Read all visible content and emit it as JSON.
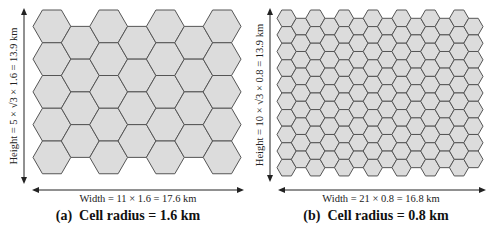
{
  "figure": {
    "panels": [
      {
        "id": "a",
        "caption": "(a)  Cell radius = 1.6 km",
        "width_label": "Width = 11 × 1.6 = 17.6 km",
        "height_label": "Height = 5 × √3 × 1.6 = 13.9 km",
        "cell_radius_km": 1.6,
        "columns": 7,
        "rows_long": 5,
        "rows_short": 4
      },
      {
        "id": "b",
        "caption": "(b)  Cell radius = 0.8 km",
        "width_label": "Width = 21 × 0.8 = 16.8 km",
        "height_label": "Height = 10 × √3 × 0.8 = 13.9 km",
        "cell_radius_km": 0.8,
        "columns": 14,
        "rows_long": 10,
        "rows_short": 9
      }
    ],
    "colors": {
      "cell_fill": "#dcdcdc",
      "cell_stroke": "#555555",
      "arrow": "#222222"
    }
  }
}
